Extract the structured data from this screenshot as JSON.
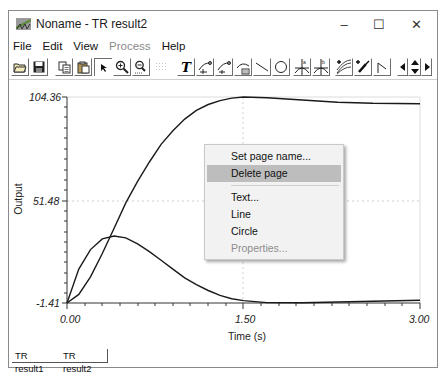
{
  "window": {
    "title": "Noname - TR result2",
    "controls": {
      "minimize": "–",
      "maximize": "☐",
      "close": "✕"
    }
  },
  "menubar": {
    "items": [
      {
        "label": "File",
        "enabled": true
      },
      {
        "label": "Edit",
        "enabled": true
      },
      {
        "label": "View",
        "enabled": true
      },
      {
        "label": "Process",
        "enabled": false
      },
      {
        "label": "Help",
        "enabled": true
      }
    ]
  },
  "toolbar": {
    "buttons": [
      {
        "icon": "open-folder-icon"
      },
      {
        "icon": "save-disk-icon"
      },
      {
        "icon": "copy-icon"
      },
      {
        "icon": "paste-icon"
      },
      {
        "icon": "pointer-arrow-icon",
        "pressed": true
      },
      {
        "icon": "zoom-in-icon"
      },
      {
        "icon": "zoom-out-100-icon"
      },
      {
        "icon": "grid-icon"
      },
      {
        "icon": "text-tool-icon",
        "glyph": "T"
      },
      {
        "icon": "curve-marker-1-icon"
      },
      {
        "icon": "curve-marker-2-icon"
      },
      {
        "icon": "curve-table-icon"
      },
      {
        "icon": "line-tool-icon"
      },
      {
        "icon": "circle-tool-icon"
      },
      {
        "icon": "cursor-a-icon"
      },
      {
        "icon": "cursor-b-icon"
      },
      {
        "icon": "add-curve-icon"
      },
      {
        "icon": "add-probe-icon"
      },
      {
        "icon": "step-line-icon"
      },
      {
        "icon": "pan-left-icon"
      },
      {
        "icon": "pan-up-down-icon"
      },
      {
        "icon": "pan-right-icon"
      }
    ]
  },
  "chart_data": {
    "type": "line",
    "title": "",
    "xlabel": "Time (s)",
    "ylabel": "Output",
    "xlim": [
      0.0,
      3.0
    ],
    "ylim": [
      -1.41,
      104.36
    ],
    "x_ticks": [
      "0.00",
      "1.50",
      "3.00"
    ],
    "y_ticks": [
      "104.36",
      "51.48",
      "-1.41"
    ],
    "grid": "dotted at middle ticks",
    "series": [
      {
        "name": "response (rising)",
        "x": [
          0.0,
          0.1,
          0.2,
          0.3,
          0.4,
          0.5,
          0.6,
          0.7,
          0.8,
          0.9,
          1.0,
          1.1,
          1.2,
          1.3,
          1.4,
          1.5,
          1.7,
          2.0,
          2.3,
          2.6,
          3.0
        ],
        "values": [
          -1.41,
          3,
          12,
          24,
          37,
          50,
          61,
          71,
          80,
          87,
          93,
          97.5,
          100.5,
          102.5,
          103.8,
          104.36,
          104.0,
          102.8,
          101.7,
          101.1,
          100.9
        ]
      },
      {
        "name": "response (pulse)",
        "x": [
          0.0,
          0.1,
          0.2,
          0.3,
          0.4,
          0.5,
          0.6,
          0.7,
          0.8,
          0.9,
          1.0,
          1.1,
          1.2,
          1.3,
          1.4,
          1.5,
          1.7,
          2.0,
          2.3,
          2.6,
          3.0
        ],
        "values": [
          -1.41,
          16,
          26,
          31.5,
          33,
          32,
          29,
          25,
          20.5,
          16,
          11.5,
          8,
          5,
          2.5,
          0.8,
          -0.2,
          -1.2,
          -1.3,
          -0.9,
          -0.5,
          0.0
        ]
      }
    ]
  },
  "context_menu": {
    "items": [
      {
        "label": "Set page name...",
        "enabled": true,
        "highlighted": false
      },
      {
        "label": "Delete page",
        "enabled": true,
        "highlighted": true
      },
      {
        "separator": true
      },
      {
        "label": "Text...",
        "enabled": true,
        "highlighted": false
      },
      {
        "label": "Line",
        "enabled": true,
        "highlighted": false
      },
      {
        "label": "Circle",
        "enabled": true,
        "highlighted": false
      },
      {
        "label": "Properties...",
        "enabled": false,
        "highlighted": false
      }
    ]
  },
  "tabs": [
    {
      "label": "TR result1",
      "active": false
    },
    {
      "label": "TR result2",
      "active": true
    }
  ],
  "colors": {
    "curve": "#1a1a1a",
    "menu_highlight": "#bdbdbd",
    "disabled_text": "#8a8a8a"
  }
}
